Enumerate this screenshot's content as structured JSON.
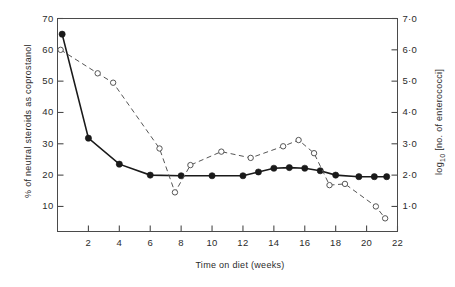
{
  "chart_data": {
    "type": "line",
    "title": "",
    "xlabel": "Time on diet (weeks)",
    "ylabel": "% of neutral steroids as coprostanol",
    "ylabel_right": "log10 [no. of enterococci]",
    "xlim": [
      0,
      22
    ],
    "ylim": [
      2,
      70
    ],
    "ylim_right": [
      0.2,
      7.0
    ],
    "grid": false,
    "legend": "none",
    "xticks": [
      2,
      4,
      6,
      8,
      10,
      12,
      14,
      16,
      18,
      20,
      22
    ],
    "xtick_labels": [
      "2",
      "4",
      "6",
      "8",
      "10",
      "12",
      "14",
      "16",
      "18",
      "20",
      "22"
    ],
    "yticks": [
      10,
      20,
      30,
      40,
      50,
      60,
      70
    ],
    "ytick_labels": [
      "10",
      "20",
      "30",
      "40",
      "50",
      "60",
      "70"
    ],
    "yticks_right": [
      1.0,
      2.0,
      3.0,
      4.0,
      5.0,
      6.0,
      7.0
    ],
    "ytick_labels_right": [
      "1·0",
      "2·0",
      "3·0",
      "4·0",
      "5·0",
      "6·0",
      "7·0"
    ],
    "series": [
      {
        "name": "% of neutral steroids as coprostanol",
        "marker": "filled-circle",
        "line": "solid",
        "color": "#1a1a1a",
        "axis": "left",
        "points": [
          {
            "x": 0.3,
            "y": 65.0
          },
          {
            "x": 2.0,
            "y": 31.8
          },
          {
            "x": 4.0,
            "y": 23.5
          },
          {
            "x": 6.0,
            "y": 20.0
          },
          {
            "x": 8.0,
            "y": 19.8
          },
          {
            "x": 10.0,
            "y": 19.8
          },
          {
            "x": 12.0,
            "y": 19.8
          },
          {
            "x": 13.0,
            "y": 21.0
          },
          {
            "x": 14.0,
            "y": 22.2
          },
          {
            "x": 15.0,
            "y": 22.4
          },
          {
            "x": 16.0,
            "y": 22.2
          },
          {
            "x": 17.0,
            "y": 21.4
          },
          {
            "x": 18.0,
            "y": 20.0
          },
          {
            "x": 19.5,
            "y": 19.5
          },
          {
            "x": 20.5,
            "y": 19.5
          },
          {
            "x": 21.3,
            "y": 19.5
          }
        ]
      },
      {
        "name": "log10 [no. of enterococci]",
        "marker": "open-circle",
        "line": "dashed",
        "color": "#555555",
        "axis": "right",
        "points": [
          {
            "x": 0.2,
            "y": 6.0
          },
          {
            "x": 2.6,
            "y": 5.25
          },
          {
            "x": 3.6,
            "y": 4.95
          },
          {
            "x": 6.6,
            "y": 2.85
          },
          {
            "x": 7.6,
            "y": 1.45
          },
          {
            "x": 8.6,
            "y": 2.32
          },
          {
            "x": 10.6,
            "y": 2.75
          },
          {
            "x": 12.5,
            "y": 2.55
          },
          {
            "x": 14.6,
            "y": 2.92
          },
          {
            "x": 15.6,
            "y": 3.12
          },
          {
            "x": 16.6,
            "y": 2.7
          },
          {
            "x": 17.6,
            "y": 1.68
          },
          {
            "x": 18.6,
            "y": 1.72
          },
          {
            "x": 20.6,
            "y": 1.0
          },
          {
            "x": 21.2,
            "y": 0.62
          }
        ]
      }
    ]
  }
}
